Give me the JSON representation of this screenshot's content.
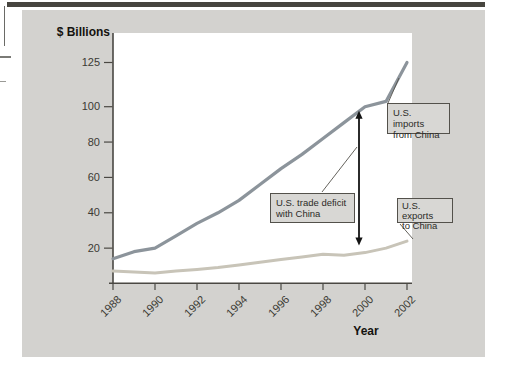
{
  "labels": {
    "y_axis_title": "$ Billions",
    "x_axis_title": "Year",
    "imports_line1": "U.S. imports",
    "imports_line2": "from China",
    "deficit_line1": "U.S. trade deficit",
    "deficit_line2": "with China",
    "exports_line1": "U.S. exports",
    "exports_line2": "to China"
  },
  "chart_data": {
    "type": "line",
    "title": "",
    "xlabel": "Year",
    "ylabel": "$ Billions",
    "x": [
      1988,
      1989,
      1990,
      1991,
      1992,
      1993,
      1994,
      1995,
      1996,
      1997,
      1998,
      1999,
      2000,
      2001,
      2002
    ],
    "x_tick_labels": [
      "1988",
      "1990",
      "1992",
      "1994",
      "1996",
      "1998",
      "2000",
      "2002"
    ],
    "y_ticks": [
      20,
      40,
      60,
      80,
      100,
      125
    ],
    "y_tick_labels": [
      "20",
      "40",
      "60",
      "80",
      "100",
      "125"
    ],
    "ylim": [
      0,
      140
    ],
    "grid": false,
    "legend_position": "callout-boxes-on-plot",
    "series": [
      {
        "name": "U.S. imports from China",
        "color": "#8c949b",
        "values": [
          14,
          18,
          20,
          27,
          34,
          40,
          47,
          56,
          65,
          73,
          82,
          91,
          100,
          103,
          125
        ]
      },
      {
        "name": "U.S. exports to China",
        "color": "#c8c4b8",
        "values": [
          7,
          6.5,
          6,
          7,
          8,
          9,
          10.5,
          12,
          13.5,
          15,
          16.5,
          16,
          17.5,
          20,
          24
        ]
      }
    ],
    "annotations": [
      {
        "id": "deficit_arrow",
        "type": "vertical-double-arrow",
        "year": 2000,
        "between": [
          "U.S. exports to China",
          "U.S. imports from China"
        ],
        "meaning": "U.S. trade deficit with China"
      },
      {
        "id": "imports_label",
        "text": "U.S. imports from China"
      },
      {
        "id": "deficit_label",
        "text": "U.S. trade deficit with China"
      },
      {
        "id": "exports_label",
        "text": "U.S. exports to China"
      }
    ]
  },
  "colors": {
    "panel": "#d3d2cf",
    "plot_bg": "#ffffff",
    "top_bar": "#47453f",
    "axis": "#4a4843",
    "imports_line": "#8c949b",
    "exports_line": "#c8c4b8",
    "label_box_bg": "#d8d7d4",
    "label_box_border": "#53514b",
    "arrow": "#141414"
  }
}
